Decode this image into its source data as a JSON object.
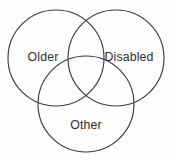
{
  "diagram": {
    "type": "venn-3-set",
    "title": "",
    "background_color": "#fefefe",
    "stroke_color": "#3b3b3b",
    "text_color": "#2f2f2f",
    "sets": [
      {
        "id": "older",
        "label": "Older",
        "center_x": 56,
        "center_y": 58,
        "radius": 48,
        "label_x": 43,
        "label_y": 58
      },
      {
        "id": "disabled",
        "label": "Disabled",
        "center_x": 116,
        "center_y": 58,
        "radius": 48,
        "label_x": 129,
        "label_y": 58
      },
      {
        "id": "other",
        "label": "Other",
        "center_x": 86,
        "center_y": 104,
        "radius": 48,
        "label_x": 86,
        "label_y": 126
      }
    ]
  }
}
